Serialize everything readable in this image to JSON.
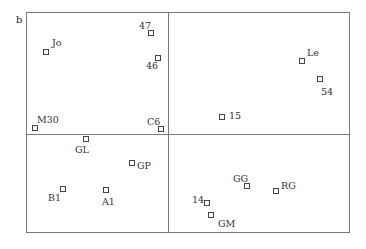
{
  "figure": {
    "panel_label": "b",
    "frame": {
      "left": 26,
      "top": 12,
      "right": 350,
      "bottom": 233
    },
    "divider_x": 168,
    "divider_y": 134,
    "line_color": "#777777"
  },
  "chart_data": {
    "type": "scatter",
    "title": "",
    "panel": "b",
    "xlabel": "",
    "ylabel": "",
    "grid": false,
    "quadrants": "frame divided into four quadrants by a vertical and horizontal line",
    "points": [
      {
        "label": "Jo",
        "x": 46,
        "y": 52,
        "lx": 52,
        "ly": 38,
        "quadrant": "top-left"
      },
      {
        "label": "47",
        "x": 151,
        "y": 33,
        "lx": 139,
        "ly": 21,
        "quadrant": "top-left"
      },
      {
        "label": "46",
        "x": 158,
        "y": 58,
        "lx": 146,
        "ly": 61,
        "quadrant": "top-left"
      },
      {
        "label": "M30",
        "x": 35,
        "y": 128,
        "lx": 37,
        "ly": 115,
        "quadrant": "top-left"
      },
      {
        "label": "C6",
        "x": 161,
        "y": 129,
        "lx": 147,
        "ly": 117,
        "quadrant": "top-left"
      },
      {
        "label": "Le",
        "x": 302,
        "y": 61,
        "lx": 307,
        "ly": 48,
        "quadrant": "top-right"
      },
      {
        "label": "54",
        "x": 320,
        "y": 79,
        "lx": 321,
        "ly": 87,
        "quadrant": "top-right"
      },
      {
        "label": "15",
        "x": 222,
        "y": 117,
        "lx": 229,
        "ly": 111,
        "quadrant": "top-right"
      },
      {
        "label": "GL",
        "x": 86,
        "y": 139,
        "lx": 75,
        "ly": 145,
        "quadrant": "bottom-left"
      },
      {
        "label": "GP",
        "x": 132,
        "y": 163,
        "lx": 137,
        "ly": 161,
        "quadrant": "bottom-left"
      },
      {
        "label": "B1",
        "x": 63,
        "y": 189,
        "lx": 48,
        "ly": 193,
        "quadrant": "bottom-left"
      },
      {
        "label": "A1",
        "x": 106,
        "y": 190,
        "lx": 102,
        "ly": 197,
        "quadrant": "bottom-left"
      },
      {
        "label": "GG",
        "x": 247,
        "y": 186,
        "lx": 233,
        "ly": 174,
        "quadrant": "bottom-right"
      },
      {
        "label": "RG",
        "x": 276,
        "y": 191,
        "lx": 281,
        "ly": 181,
        "quadrant": "bottom-right"
      },
      {
        "label": "14",
        "x": 207,
        "y": 203,
        "lx": 192,
        "ly": 195,
        "quadrant": "bottom-right"
      },
      {
        "label": "GM",
        "x": 211,
        "y": 215,
        "lx": 218,
        "ly": 219,
        "quadrant": "bottom-right"
      }
    ]
  }
}
